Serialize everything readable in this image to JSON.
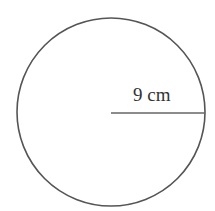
{
  "diagram": {
    "shape": "circle",
    "radius_label": "9 cm",
    "stroke_color": "#555555",
    "background_color": "#ffffff"
  }
}
